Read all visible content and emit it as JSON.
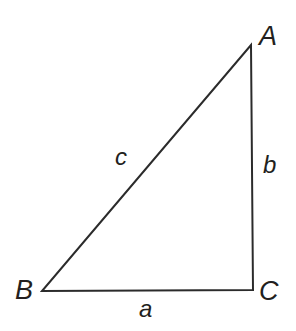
{
  "figure": {
    "kind": "right-triangle-diagram",
    "background_color": "#ffffff",
    "stroke_color": "#2b2b2b",
    "stroke_width": 2,
    "canvas": {
      "width": 296,
      "height": 331
    },
    "vertices": {
      "A": {
        "x": 251,
        "y": 45,
        "label": "A",
        "label_x": 259,
        "label_y": 23
      },
      "B": {
        "x": 42,
        "y": 291,
        "label": "B",
        "label_x": 15,
        "label_y": 277
      },
      "C": {
        "x": 253,
        "y": 290,
        "label": "C",
        "label_x": 259,
        "label_y": 278
      }
    },
    "sides": [
      {
        "id": "a",
        "label": "a",
        "from": "B",
        "to": "C",
        "label_x": 139,
        "label_y": 297
      },
      {
        "id": "b",
        "label": "b",
        "from": "C",
        "to": "A",
        "label_x": 263,
        "label_y": 153
      },
      {
        "id": "c",
        "label": "c",
        "from": "B",
        "to": "A",
        "label_x": 115,
        "label_y": 145
      }
    ]
  }
}
